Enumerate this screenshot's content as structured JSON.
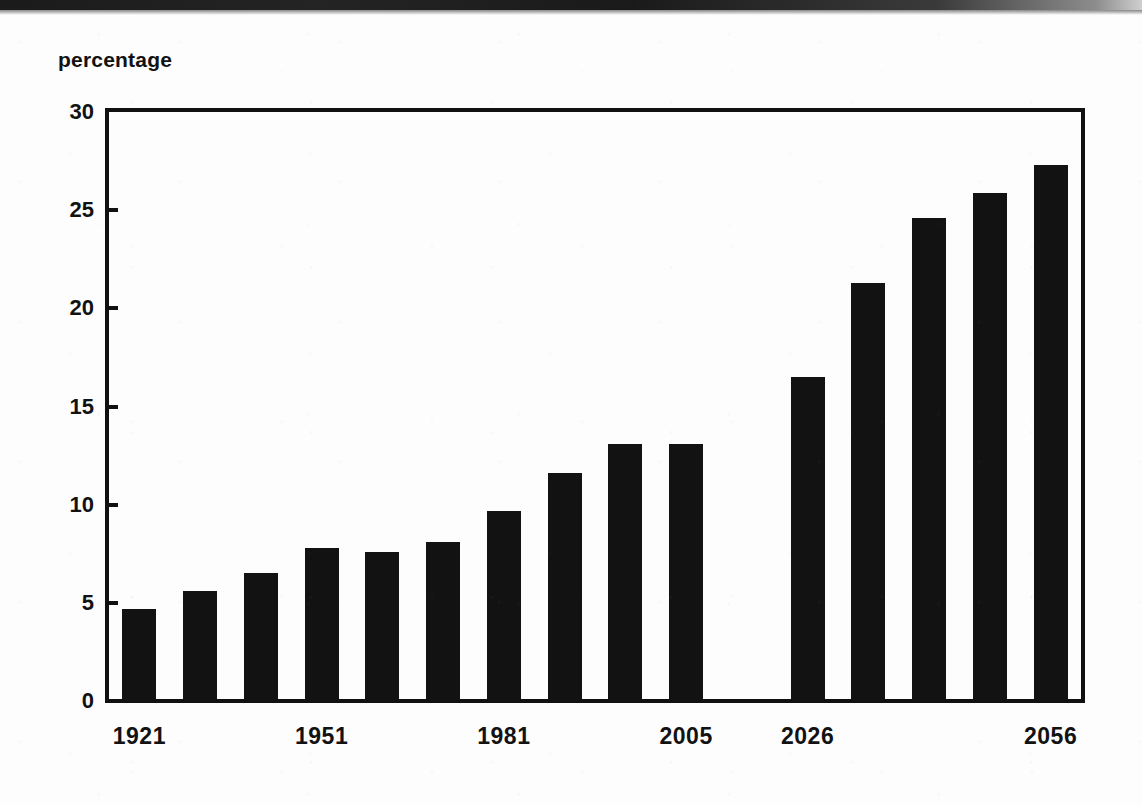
{
  "figure": {
    "y_axis_title": "percentage",
    "background_color": "#fdfdfd",
    "bar_color": "#121212",
    "axis_color": "#111111"
  },
  "chart_data": {
    "type": "bar",
    "title": "",
    "subtitle": "",
    "xlabel": "",
    "ylabel": "percentage",
    "ylim": [
      0,
      30
    ],
    "yticks": [
      0,
      5,
      10,
      15,
      20,
      25,
      30
    ],
    "ytick_labels": [
      "0",
      "5",
      "10",
      "15",
      "20",
      "25",
      "30"
    ],
    "grid": false,
    "legend": null,
    "xtick_labels": [
      "1921",
      "1951",
      "1981",
      "2005",
      "2026",
      "2056"
    ],
    "categories": [
      "1921",
      "1931",
      "1941",
      "1951",
      "1961",
      "1971",
      "1981",
      "1991",
      "2001",
      "2005",
      "",
      "2026",
      "2031",
      "2041",
      "2051",
      "2056"
    ],
    "values": [
      4.7,
      5.6,
      6.5,
      7.8,
      7.6,
      8.1,
      9.7,
      11.6,
      13.1,
      13.1,
      null,
      16.5,
      21.3,
      24.6,
      25.9,
      27.3
    ]
  },
  "bars": [
    {
      "label": "1921",
      "value": 4.7
    },
    {
      "label": "1931",
      "value": 5.6
    },
    {
      "label": "1941",
      "value": 6.5
    },
    {
      "label": "1951",
      "value": 7.8
    },
    {
      "label": "1961",
      "value": 7.6
    },
    {
      "label": "1971",
      "value": 8.1
    },
    {
      "label": "1981",
      "value": 9.7
    },
    {
      "label": "1991",
      "value": 11.6
    },
    {
      "label": "2001",
      "value": 13.1
    },
    {
      "label": "2005",
      "value": 13.1
    },
    {
      "label": "",
      "value": null
    },
    {
      "label": "2026",
      "value": 16.5
    },
    {
      "label": "2031",
      "value": 21.3
    },
    {
      "label": "2041",
      "value": 24.6
    },
    {
      "label": "2051",
      "value": 25.9
    },
    {
      "label": "2056",
      "value": 27.3
    }
  ],
  "x_axis": {
    "ticks": [
      {
        "label": "1921",
        "bar_index": 0
      },
      {
        "label": "1951",
        "bar_index": 3
      },
      {
        "label": "1981",
        "bar_index": 6
      },
      {
        "label": "2005",
        "bar_index": 9
      },
      {
        "label": "2026",
        "bar_index": 11
      },
      {
        "label": "2056",
        "bar_index": 15
      }
    ]
  },
  "y_axis": {
    "ticks": [
      {
        "label": "30",
        "value": 30
      },
      {
        "label": "25",
        "value": 25
      },
      {
        "label": "20",
        "value": 20
      },
      {
        "label": "15",
        "value": 15
      },
      {
        "label": "10",
        "value": 10
      },
      {
        "label": "5",
        "value": 5
      },
      {
        "label": "0",
        "value": 0
      }
    ]
  }
}
